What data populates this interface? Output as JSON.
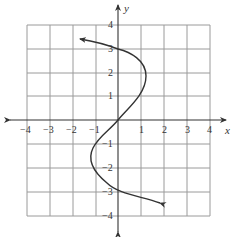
{
  "graph": {
    "x_axis_label": "x",
    "y_axis_label": "y",
    "x_ticks": [
      "−4",
      "−3",
      "−2",
      "−1",
      "1",
      "2",
      "3",
      "4"
    ],
    "y_ticks": [
      "4",
      "3",
      "2",
      "1",
      "−1",
      "−2",
      "−3",
      "−4"
    ],
    "grid_range": {
      "x": [
        -4,
        4
      ],
      "y": [
        -4,
        4
      ]
    },
    "curve_description": "Sideways cubic curve passing through (0,3), (0,0), (0,-3); bulges right near y=2 and left near y=-2; arrows at both ends",
    "colors": {
      "grid": "#9a9a9a",
      "axis": "#333333",
      "curve": "#333333"
    }
  }
}
